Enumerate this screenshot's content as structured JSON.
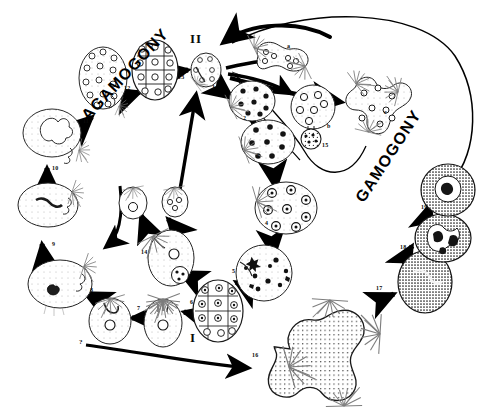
{
  "diagram": {
    "phases": [
      {
        "id": "agamogony",
        "label": "AGAMOGONY",
        "rotation": -47,
        "x": 78,
        "y": 112
      },
      {
        "id": "gamogony",
        "label": "GAMOGONY",
        "rotation": -57,
        "x": 352,
        "y": 196
      }
    ],
    "romans": [
      {
        "id": "roman-two",
        "label": "II",
        "x": 190,
        "y": 38
      },
      {
        "id": "roman-one",
        "label": "I",
        "x": 190,
        "y": 337
      }
    ],
    "stage_numbers": [
      {
        "id": "stage-1",
        "label": "1",
        "x": 212,
        "y": 88
      },
      {
        "id": "stage-2",
        "label": "2",
        "x": 243,
        "y": 119
      },
      {
        "id": "stage-3",
        "label": "3",
        "x": 256,
        "y": 157
      },
      {
        "id": "stage-4",
        "label": "4",
        "x": 265,
        "y": 224
      },
      {
        "id": "stage-5",
        "label": "5",
        "x": 232,
        "y": 272
      },
      {
        "id": "stage-6",
        "label": "6",
        "x": 190,
        "y": 303
      },
      {
        "id": "stage-7",
        "label": "7",
        "x": 137,
        "y": 309
      },
      {
        "id": "stage-8",
        "label": "8",
        "x": 90,
        "y": 291
      },
      {
        "id": "stage-9",
        "label": "9",
        "x": 52,
        "y": 245
      },
      {
        "id": "stage-10",
        "label": "10",
        "x": 52,
        "y": 169
      },
      {
        "id": "stage-11",
        "label": "11",
        "x": 83,
        "y": 122
      },
      {
        "id": "stage-12",
        "label": "12",
        "x": 124,
        "y": 89
      },
      {
        "id": "stage-13",
        "label": "13",
        "x": 178,
        "y": 78
      },
      {
        "id": "stage-14",
        "label": "14",
        "x": 141,
        "y": 253
      },
      {
        "id": "stage-15",
        "label": "15",
        "x": 322,
        "y": 146
      },
      {
        "id": "stage-16",
        "label": "16",
        "x": 252,
        "y": 356
      },
      {
        "id": "stage-17",
        "label": "17",
        "x": 376,
        "y": 289
      },
      {
        "id": "stage-18",
        "label": "18",
        "x": 400,
        "y": 248
      },
      {
        "id": "stage-19",
        "label": "19",
        "x": 421,
        "y": 208
      }
    ],
    "alpha_labels": [
      {
        "id": "label-a",
        "label": "a",
        "x": 287,
        "y": 47
      },
      {
        "id": "label-b",
        "label": "b",
        "x": 327,
        "y": 127
      },
      {
        "id": "label-c",
        "label": "c",
        "x": 384,
        "y": 113
      }
    ],
    "query_marks": [
      {
        "id": "query-left",
        "label": "?",
        "x": 79,
        "y": 343
      }
    ],
    "colors": {
      "ink": "#000000",
      "background": "#ffffff",
      "cell_outline": "#1a1a1a",
      "stipple": "#2b2b2b"
    }
  }
}
